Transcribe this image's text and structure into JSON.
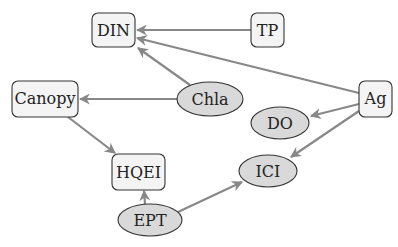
{
  "diagram": {
    "type": "directed-graph",
    "colors": {
      "edge": "#888888",
      "box_fill": "#f4f4f4",
      "ellipse_fill": "#d9d9d9",
      "stroke": "#333333"
    },
    "nodes": [
      {
        "id": "DIN",
        "label": "DIN",
        "shape": "box",
        "x": 113,
        "y": 30,
        "w": 43,
        "h": 34
      },
      {
        "id": "TP",
        "label": "TP",
        "shape": "box",
        "x": 267,
        "y": 30,
        "w": 33,
        "h": 34
      },
      {
        "id": "Canopy",
        "label": "Canopy",
        "shape": "box",
        "x": 45,
        "y": 99,
        "w": 66,
        "h": 35
      },
      {
        "id": "Chla",
        "label": "Chla",
        "shape": "ellipse",
        "x": 210,
        "y": 99,
        "rx": 33,
        "ry": 17
      },
      {
        "id": "Ag",
        "label": "Ag",
        "shape": "box",
        "x": 375,
        "y": 99,
        "w": 33,
        "h": 35
      },
      {
        "id": "DO",
        "label": "DO",
        "shape": "ellipse",
        "x": 280,
        "y": 123,
        "rx": 29,
        "ry": 16
      },
      {
        "id": "HQEI",
        "label": "HQEI",
        "shape": "box",
        "x": 138,
        "y": 172,
        "w": 53,
        "h": 35
      },
      {
        "id": "ICI",
        "label": "ICI",
        "shape": "ellipse",
        "x": 268,
        "y": 171,
        "rx": 29,
        "ry": 16
      },
      {
        "id": "EPT",
        "label": "EPT",
        "shape": "ellipse",
        "x": 150,
        "y": 220,
        "rx": 32,
        "ry": 16
      }
    ],
    "edges": [
      {
        "from": "TP",
        "to": "DIN"
      },
      {
        "from": "Ag",
        "to": "DIN"
      },
      {
        "from": "Chla",
        "to": "DIN"
      },
      {
        "from": "Chla",
        "to": "Canopy"
      },
      {
        "from": "Canopy",
        "to": "HQEI"
      },
      {
        "from": "Ag",
        "to": "DO"
      },
      {
        "from": "Ag",
        "to": "ICI"
      },
      {
        "from": "EPT",
        "to": "HQEI"
      },
      {
        "from": "EPT",
        "to": "ICI"
      }
    ]
  }
}
